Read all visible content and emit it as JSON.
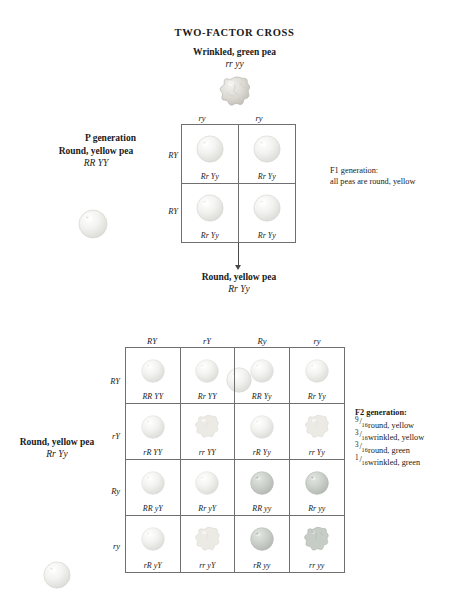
{
  "title": "TWO-FACTOR CROSS",
  "parents": {
    "top": {
      "phenotype": "Wrinkled, green pea",
      "genotype": "rr yy",
      "pea": {
        "shape": "wrinkled",
        "color": "green"
      }
    },
    "left": {
      "phenotype": "Round, yellow pea",
      "genotype": "RR YY",
      "pea": {
        "shape": "round",
        "color": "yellow"
      }
    },
    "generation_label": "P generation"
  },
  "f1_square": {
    "col_gametes": [
      "ry",
      "ry"
    ],
    "row_gametes": [
      "RY",
      "RY"
    ],
    "cells": [
      [
        {
          "genotype": "Rr Yy",
          "shape": "round",
          "color": "yellow"
        },
        {
          "genotype": "Rr Yy",
          "shape": "round",
          "color": "yellow"
        }
      ],
      [
        {
          "genotype": "Rr Yy",
          "shape": "round",
          "color": "yellow"
        },
        {
          "genotype": "Rr Yy",
          "shape": "round",
          "color": "yellow"
        }
      ]
    ]
  },
  "f1_note": {
    "line1": "F1 generation:",
    "line2": "all peas are round, yellow"
  },
  "f1_offspring": {
    "phenotype": "Round, yellow pea",
    "genotype": "Rr Yy",
    "pea": {
      "shape": "round",
      "color": "yellow"
    }
  },
  "f2_parent_left": {
    "phenotype": "Round, yellow pea",
    "genotype": "Rr Yy",
    "pea": {
      "shape": "round",
      "color": "yellow"
    }
  },
  "f2_square": {
    "col_gametes": [
      "RY",
      "rY",
      "Ry",
      "ry"
    ],
    "row_gametes": [
      "RY",
      "rY",
      "Ry",
      "ry"
    ],
    "cells": [
      [
        {
          "genotype": "RR YY",
          "shape": "round",
          "color": "yellow"
        },
        {
          "genotype": "Rr YY",
          "shape": "round",
          "color": "yellow"
        },
        {
          "genotype": "RR Yy",
          "shape": "round",
          "color": "yellow"
        },
        {
          "genotype": "Rr Yy",
          "shape": "round",
          "color": "yellow"
        }
      ],
      [
        {
          "genotype": "rR YY",
          "shape": "round",
          "color": "yellow"
        },
        {
          "genotype": "rr YY",
          "shape": "wrinkled",
          "color": "yellow"
        },
        {
          "genotype": "rR Yy",
          "shape": "round",
          "color": "yellow"
        },
        {
          "genotype": "rr Yy",
          "shape": "wrinkled",
          "color": "yellow"
        }
      ],
      [
        {
          "genotype": "RR yY",
          "shape": "round",
          "color": "yellow"
        },
        {
          "genotype": "Rr yY",
          "shape": "round",
          "color": "yellow"
        },
        {
          "genotype": "RR yy",
          "shape": "round",
          "color": "green"
        },
        {
          "genotype": "Rr yy",
          "shape": "round",
          "color": "green"
        }
      ],
      [
        {
          "genotype": "rR yY",
          "shape": "round",
          "color": "yellow"
        },
        {
          "genotype": "rr yY",
          "shape": "wrinkled",
          "color": "yellow"
        },
        {
          "genotype": "rR yy",
          "shape": "round",
          "color": "green"
        },
        {
          "genotype": "rr yy",
          "shape": "wrinkled",
          "color": "green"
        }
      ]
    ]
  },
  "f2_note": {
    "heading": "F2 generation:",
    "ratios": [
      {
        "num": "9",
        "den": "16",
        "text": "round, yellow"
      },
      {
        "num": "3",
        "den": "16",
        "text": "wrinkled, yellow"
      },
      {
        "num": "3",
        "den": "16",
        "text": "round, green"
      },
      {
        "num": "1",
        "den": "16",
        "text": "wrinkled, green"
      }
    ]
  },
  "colors": {
    "yellow_pea": "#f0f0ee",
    "green_pea": "#c9cec9",
    "wrinkled_pea": "#dcdad4",
    "rule": "#6f6f6f",
    "arrow": "#4a4a4a",
    "text": "#1a1a1a"
  }
}
